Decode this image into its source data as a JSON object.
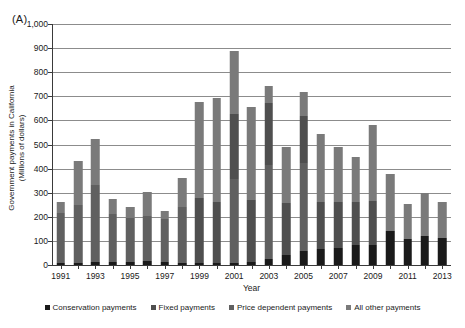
{
  "panel": {
    "label": "(A)"
  },
  "chart_data": {
    "type": "bar",
    "title": "",
    "subtitle": "",
    "stacked": true,
    "xlabel": "Year",
    "ylabel": "Government payments in California (Millions of dollars)",
    "ylabel_line1": "Government payments in California",
    "ylabel_line2": "(Millions of dollars)",
    "ylim": [
      0,
      1000
    ],
    "ytick_labels": [
      "0",
      "100",
      "200",
      "300",
      "400",
      "500",
      "600",
      "700",
      "800",
      "900",
      "1,000"
    ],
    "yticks": [
      0,
      100,
      200,
      300,
      400,
      500,
      600,
      700,
      800,
      900,
      1000
    ],
    "grid": true,
    "grid_axis": "y",
    "legend_position": "bottom",
    "categories": [
      "1991",
      "1992",
      "1993",
      "1994",
      "1995",
      "1996",
      "1997",
      "1998",
      "1999",
      "2000",
      "2001",
      "2002",
      "2003",
      "2004",
      "2005",
      "2006",
      "2007",
      "2008",
      "2009",
      "2010",
      "2011",
      "2012",
      "2013"
    ],
    "xtick_labels": [
      "1991",
      "1993",
      "1995",
      "1997",
      "1999",
      "2001",
      "2003",
      "2005",
      "2007",
      "2009",
      "2011",
      "2013"
    ],
    "series": [
      {
        "name": "Conservation payments",
        "color": "#1a1a1a",
        "values": [
          10,
          10,
          12,
          12,
          14,
          17,
          14,
          10,
          10,
          10,
          8,
          14,
          27,
          41,
          57,
          66,
          70,
          81,
          81,
          140,
          107,
          120,
          112
        ]
      },
      {
        "name": "Fixed payments",
        "color": "#4f4f4f",
        "values": [
          0,
          0,
          0,
          0,
          0,
          0,
          0,
          0,
          270,
          250,
          270,
          255,
          255,
          215,
          195,
          195,
          190,
          180,
          185,
          0,
          0,
          0,
          0
        ]
      },
      {
        "name": "Price dependent payments",
        "color": "#606060",
        "values": [
          205,
          240,
          318,
          200,
          180,
          185,
          175,
          230,
          0,
          0,
          350,
          0,
          390,
          0,
          365,
          0,
          0,
          0,
          0,
          0,
          0,
          0,
          0
        ]
      },
      {
        "name": "All other payments",
        "color": "#7a7a7a",
        "values": [
          45,
          183,
          195,
          62,
          48,
          103,
          35,
          123,
          395,
          435,
          262,
          385,
          71,
          232,
          100,
          281,
          231,
          187,
          315,
          237,
          148,
          177,
          151
        ]
      }
    ],
    "totals": [
      260,
      433,
      525,
      274,
      242,
      305,
      224,
      363,
      675,
      695,
      890,
      654,
      743,
      488,
      717,
      542,
      491,
      448,
      581,
      377,
      255,
      297,
      263
    ]
  }
}
